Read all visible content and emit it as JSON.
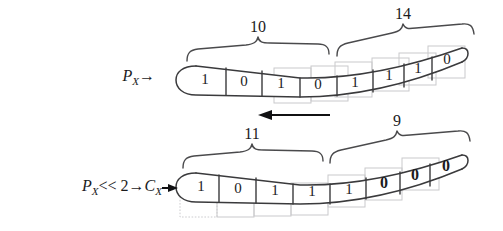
{
  "figure": {
    "background_color": "#ffffff",
    "ink_color": "#3a3a3c",
    "ghost_color": "#c9c9cc"
  },
  "rows": [
    {
      "id": "top",
      "label": {
        "full_text": "P_X →",
        "base": "P",
        "subscript": "X",
        "arrow": "→"
      },
      "bits": [
        "1",
        "0",
        "1",
        "0",
        "1",
        "1",
        "1",
        "0"
      ],
      "bits_bold": [
        false,
        false,
        false,
        false,
        false,
        false,
        false,
        false
      ],
      "braces": [
        {
          "label": "10",
          "start_bit": 0,
          "end_bit": 3
        },
        {
          "label": "14",
          "start_bit": 4,
          "end_bit": 7
        }
      ]
    },
    {
      "id": "bottom",
      "label": {
        "full_text": "P_X << 2 → C_X →",
        "base": "P",
        "subscript": "X",
        "operator": "<< 2",
        "arrow": "→",
        "result_base": "C",
        "result_subscript": "X",
        "result_arrow": "→"
      },
      "bits": [
        "1",
        "0",
        "1",
        "1",
        "1",
        "0",
        "0",
        "0"
      ],
      "bits_bold": [
        false,
        false,
        false,
        false,
        false,
        false,
        true,
        true
      ],
      "braces": [
        {
          "label": "11",
          "start_bit": 0,
          "end_bit": 3
        },
        {
          "label": "9",
          "start_bit": 4,
          "end_bit": 7
        }
      ]
    }
  ],
  "shift_arrow": {
    "direction": "left",
    "glyph": "←"
  }
}
